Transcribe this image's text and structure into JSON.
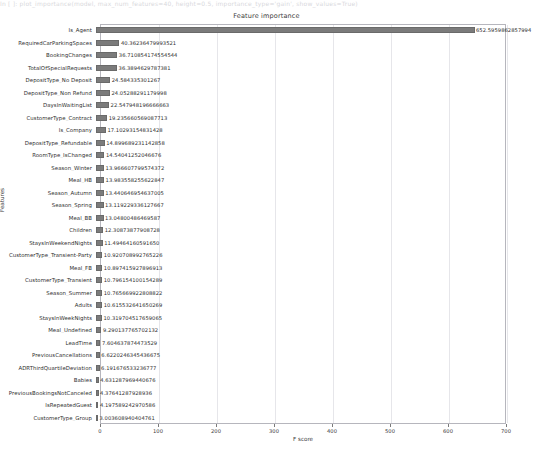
{
  "top_strip_text": "In [ ]:  plot_importance(model, max_num_features=40, height=0.5, importance_type='gain', show_values=True)",
  "chart_data": {
    "type": "bar",
    "orientation": "horizontal",
    "title": "Feature importance",
    "xlabel": "F score",
    "ylabel": "Features",
    "xlim": [
      0,
      700
    ],
    "xticks": [
      0,
      100,
      200,
      300,
      400,
      500,
      600,
      700
    ],
    "grid": true,
    "legend": null,
    "bar_color": "#7b7b7b",
    "categories": [
      "Is_Agent",
      "RequiredCarParkingSpaces",
      "BookingChanges",
      "TotalOfSpecialRequests",
      "DepositType_No Deposit",
      "DepositType_Non Refund",
      "DaysInWaitingList",
      "CustomerType_Contract",
      "Is_Company",
      "DepositType_Refundable",
      "RoomType_IsChanged",
      "Season_Winter",
      "Meal_HB",
      "Season_Autumn",
      "Season_Spring",
      "Meal_BB",
      "Children",
      "StaysInWeekendNights",
      "CustomerType_Transient-Party",
      "Meal_FB",
      "CustomerType_Transient",
      "Season_Summer",
      "Adults",
      "StaysInWeekNights",
      "Meal_Undefined",
      "LeadTime",
      "PreviousCancellations",
      "ADRThirdQuartileDeviation",
      "Babies",
      "PreviousBookingsNotCanceled",
      "IsRepeatedGuest",
      "CustomerType_Group"
    ],
    "values": [
      652.5959862857994,
      40.36236479993521,
      36.71085417455454,
      36.3894629787381,
      24.584335301267,
      24.05288291179998,
      22.547948196666663,
      19.235660569087713,
      17.10293154831428,
      14.899689231142858,
      14.54041252046676,
      13.966607799574373,
      13.983558255622848,
      13.440646954637005,
      13.119229336127667,
      13.04800486469587,
      12.30873877908728,
      11.4946416059165,
      10.920708992765226,
      10.897415927896914,
      10.79615410015429,
      10.765669922808822,
      10.615532641650269,
      10.319704517659066,
      9.290137765702132,
      7.604637874473529,
      6.622024634543667,
      6.191676533236777,
      4.631287969440676,
      4.37641287928936,
      4.197589242970586,
      3.003608940404761
    ],
    "value_labels": [
      "652.5959862857994",
      "40.36236479993521",
      "36.710854174554544",
      "36.3894629787381",
      "24.584335301267",
      "24.05288291179998",
      "22.547948196666663",
      "19.235660569087713",
      "17.10293154831428",
      "14.899689231142858",
      "14.54041252046676",
      "13.966607799574372",
      "13.983558255622847",
      "13.440646954637005",
      "13.119229336127667",
      "13.04800486469587",
      "12.30873877908728",
      "11.49464160591650",
      "10.920708992765226",
      "10.897415927896913",
      "10.796154100154289",
      "10.765669922808822",
      "10.615532641650269",
      "10.319704517659065",
      "9.290137765702132",
      "7.604637874473529",
      "6.6220246345436675",
      "6.191676533236777",
      "4.631287969440676",
      "4.37641287928936",
      "4.197589242970586",
      "3.003608940404761"
    ]
  }
}
